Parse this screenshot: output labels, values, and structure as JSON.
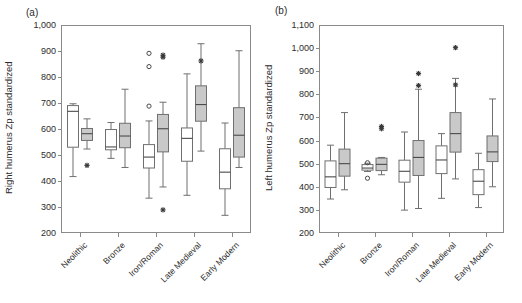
{
  "figure": {
    "panels": [
      {
        "key": "a",
        "label": "(a)",
        "ylabel": "Right humerus Zp standardized",
        "ylim": [
          200,
          1000
        ],
        "yticks": [
          200,
          300,
          400,
          500,
          600,
          700,
          800,
          900,
          1000
        ],
        "ytick_labels": [
          "200",
          "300",
          "400",
          "500",
          "600",
          "700",
          "800",
          "900",
          "1,000"
        ],
        "categories": [
          "Neolithic",
          "Bronze",
          "Iron/Roman",
          "Late Medieval",
          "Early Modern"
        ]
      },
      {
        "key": "b",
        "label": "(b)",
        "ylabel": "Left humerus Zp standardized",
        "ylim": [
          200,
          1100
        ],
        "yticks": [
          200,
          300,
          400,
          500,
          600,
          700,
          800,
          900,
          1000,
          1100
        ],
        "ytick_labels": [
          "200",
          "300",
          "400",
          "500",
          "600",
          "700",
          "800",
          "900",
          "1,000",
          "1,100"
        ],
        "categories": [
          "Neolithic",
          "Bronze",
          "Iron/Roman",
          "Late Medieval",
          "Early Modern"
        ]
      }
    ]
  },
  "chart_data": [
    {
      "type": "box",
      "panel": "(a)",
      "title": "Right humerus Zp standardized",
      "xlabel": "",
      "ylabel": "Right humerus Zp standardized",
      "ylim": [
        200,
        1000
      ],
      "yticks": [
        200,
        300,
        400,
        500,
        600,
        700,
        800,
        900,
        1000
      ],
      "grid": false,
      "legend": "none",
      "categories": [
        "Neolithic",
        "Bronze",
        "Iron/Roman",
        "Late Medieval",
        "Early Modern"
      ],
      "series": [
        {
          "name": "open",
          "fill": "#ffffff",
          "boxes": [
            {
              "category": "Neolithic",
              "whisker_low": 417,
              "q1": 530,
              "median": 668,
              "q3": 690,
              "whisker_high": 697,
              "outliers": []
            },
            {
              "category": "Bronze",
              "whisker_low": 487,
              "q1": 520,
              "median": 531,
              "q3": 598,
              "whisker_high": 625,
              "outliers": []
            },
            {
              "category": "Iron/Roman",
              "whisker_low": 334,
              "q1": 450,
              "median": 492,
              "q3": 540,
              "whisker_high": 631,
              "outliers": [
                688,
                840,
                891
              ]
            },
            {
              "category": "Late Medieval",
              "whisker_low": 345,
              "q1": 476,
              "median": 564,
              "q3": 604,
              "whisker_high": 812,
              "outliers": []
            },
            {
              "category": "Early Modern",
              "whisker_low": 268,
              "q1": 370,
              "median": 434,
              "q3": 524,
              "whisker_high": 623,
              "outliers": []
            }
          ]
        },
        {
          "name": "shaded",
          "fill": "#c9c9c9",
          "boxes": [
            {
              "category": "Neolithic",
              "whisker_low": 523,
              "q1": 556,
              "median": 582,
              "q3": 602,
              "whisker_high": 639,
              "outliers": [
                460
              ]
            },
            {
              "category": "Bronze",
              "whisker_low": 452,
              "q1": 528,
              "median": 573,
              "q3": 622,
              "whisker_high": 753,
              "outliers": []
            },
            {
              "category": "Iron/Roman",
              "whisker_low": 377,
              "q1": 512,
              "median": 601,
              "q3": 656,
              "whisker_high": 703,
              "outliers": [
                289,
                876,
                884
              ]
            },
            {
              "category": "Late Medieval",
              "whisker_low": 515,
              "q1": 630,
              "median": 694,
              "q3": 766,
              "whisker_high": 928,
              "outliers": [
                862
              ]
            },
            {
              "category": "Early Modern",
              "whisker_low": 452,
              "q1": 492,
              "median": 576,
              "q3": 682,
              "whisker_high": 901,
              "outliers": []
            }
          ]
        }
      ]
    },
    {
      "type": "box",
      "panel": "(b)",
      "title": "Left humerus Zp standardized",
      "xlabel": "",
      "ylabel": "Left humerus Zp standardized",
      "ylim": [
        200,
        1100
      ],
      "yticks": [
        200,
        300,
        400,
        500,
        600,
        700,
        800,
        900,
        1000,
        1100
      ],
      "grid": false,
      "legend": "none",
      "categories": [
        "Neolithic",
        "Bronze",
        "Iron/Roman",
        "Late Medieval",
        "Early Modern"
      ],
      "series": [
        {
          "name": "open",
          "fill": "#ffffff",
          "boxes": [
            {
              "category": "Neolithic",
              "whisker_low": 347,
              "q1": 397,
              "median": 443,
              "q3": 512,
              "whisker_high": 580,
              "outliers": []
            },
            {
              "category": "Bronze",
              "whisker_low": 466,
              "q1": 472,
              "median": 481,
              "q3": 496,
              "whisker_high": 502,
              "outliers": [
                437,
                504
              ]
            },
            {
              "category": "Iron/Roman",
              "whisker_low": 299,
              "q1": 420,
              "median": 467,
              "q3": 515,
              "whisker_high": 637,
              "outliers": []
            },
            {
              "category": "Late Medieval",
              "whisker_low": 350,
              "q1": 457,
              "median": 516,
              "q3": 577,
              "whisker_high": 630,
              "outliers": []
            },
            {
              "category": "Early Modern",
              "whisker_low": 310,
              "q1": 366,
              "median": 424,
              "q3": 474,
              "whisker_high": 545,
              "outliers": []
            }
          ]
        },
        {
          "name": "shaded",
          "fill": "#c9c9c9",
          "boxes": [
            {
              "category": "Neolithic",
              "whisker_low": 387,
              "q1": 446,
              "median": 500,
              "q3": 563,
              "whisker_high": 721,
              "outliers": []
            },
            {
              "category": "Bronze",
              "whisker_low": 452,
              "q1": 470,
              "median": 497,
              "q3": 524,
              "whisker_high": 527,
              "outliers": [
                651,
                661
              ]
            },
            {
              "category": "Iron/Roman",
              "whisker_low": 306,
              "q1": 449,
              "median": 527,
              "q3": 600,
              "whisker_high": 822,
              "outliers": [
                838,
                890
              ]
            },
            {
              "category": "Late Medieval",
              "whisker_low": 434,
              "q1": 550,
              "median": 630,
              "q3": 721,
              "whisker_high": 869,
              "outliers": [
                841,
                1002
              ]
            },
            {
              "category": "Early Modern",
              "whisker_low": 400,
              "q1": 509,
              "median": 551,
              "q3": 620,
              "whisker_high": 780,
              "outliers": []
            }
          ]
        }
      ]
    }
  ]
}
